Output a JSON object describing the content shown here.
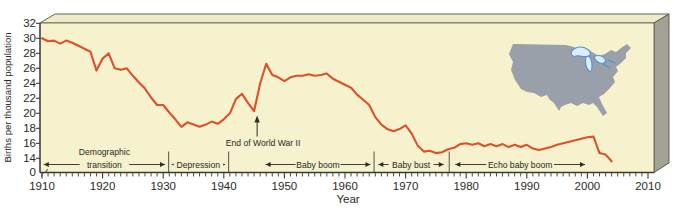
{
  "colors": {
    "page_background": "#ffffff",
    "plot_background": "#f5f2cd",
    "line": "#df5028",
    "axis": "#3c3b33",
    "text": "#2a2a24",
    "box_top_face": "#eeebc9",
    "box_side_face": "#a2a295",
    "box_outline": "#55544a",
    "map_land": "#9aa0a9",
    "map_lakes_stroke": "#4a93d6",
    "map_lakes_fill": "#ddeefb"
  },
  "figure": {
    "y_axis_title": "Births per thousand population",
    "x_axis_title": "Year"
  },
  "annotations": {
    "wwii_label": "End of World War II",
    "wwii_year": 1945.5,
    "divider_years": [
      1930.9,
      1940.8,
      1964.8,
      1977.2
    ],
    "periods": [
      {
        "id": "demographic-transition",
        "label_above": "Demographic",
        "label": "transition",
        "start": 1910.3,
        "end": 1930.3
      },
      {
        "id": "depression",
        "label_above": "",
        "label": "Depression",
        "start": 1931.4,
        "end": 1940.2
      },
      {
        "id": "baby-boom",
        "label_above": "",
        "label": "Baby boom",
        "start": 1946.9,
        "end": 1964.2
      },
      {
        "id": "baby-bust",
        "label_above": "",
        "label": "Baby bust",
        "start": 1965.5,
        "end": 1976.3
      },
      {
        "id": "echo-baby-boom",
        "label_above": "",
        "label": "Echo baby boom",
        "start": 1978.2,
        "end": 1999.6
      }
    ]
  },
  "chart_data": {
    "type": "line",
    "xlabel": "Year",
    "ylabel": "Births per thousand population",
    "x_range": [
      1910,
      2010
    ],
    "y_ticks": [
      0,
      14,
      16,
      18,
      20,
      22,
      24,
      26,
      28,
      30,
      32
    ],
    "y_axis_break_between": [
      0,
      14
    ],
    "x_tick_labels": [
      "1910",
      "1920",
      "1930",
      "1940",
      "1950",
      "1960",
      "1970",
      "1980",
      "1990",
      "2000",
      "2010"
    ],
    "grid": false,
    "legend": "none",
    "inset": "united-states-map",
    "series": [
      {
        "name": "U.S. births per thousand population",
        "color": "#df5028",
        "x": [
          1910,
          1911,
          1912,
          1913,
          1914,
          1915,
          1916,
          1917,
          1918,
          1919,
          1920,
          1921,
          1922,
          1923,
          1924,
          1925,
          1926,
          1927,
          1928,
          1929,
          1930,
          1931,
          1932,
          1933,
          1934,
          1935,
          1936,
          1937,
          1938,
          1939,
          1940,
          1941,
          1942,
          1943,
          1944,
          1945,
          1946,
          1947,
          1948,
          1949,
          1950,
          1951,
          1952,
          1953,
          1954,
          1955,
          1956,
          1957,
          1958,
          1959,
          1960,
          1961,
          1962,
          1963,
          1964,
          1965,
          1966,
          1967,
          1968,
          1969,
          1970,
          1971,
          1972,
          1973,
          1974,
          1975,
          1976,
          1977,
          1978,
          1979,
          1980,
          1981,
          1982,
          1983,
          1984,
          1985,
          1986,
          1987,
          1988,
          1989,
          1990,
          1991,
          1992,
          1993,
          1994,
          1995,
          1996,
          1997,
          1998,
          1999,
          2000,
          2001,
          2002,
          2003,
          2004
        ],
        "values": [
          30.0,
          29.6,
          29.7,
          29.3,
          29.7,
          29.4,
          29.0,
          28.6,
          28.2,
          25.7,
          27.3,
          28.0,
          26.0,
          25.8,
          26.0,
          25.0,
          24.1,
          23.3,
          22.1,
          21.1,
          21.1,
          20.1,
          19.2,
          18.2,
          18.8,
          18.5,
          18.2,
          18.5,
          18.9,
          18.6,
          19.2,
          20.0,
          21.9,
          22.6,
          21.4,
          20.3,
          24.0,
          26.6,
          25.1,
          24.8,
          24.3,
          24.8,
          25.0,
          25.0,
          25.2,
          25.0,
          25.1,
          25.3,
          24.6,
          24.2,
          23.8,
          23.4,
          22.5,
          21.8,
          21.1,
          19.5,
          18.5,
          17.9,
          17.6,
          17.9,
          18.4,
          17.3,
          15.7,
          14.9,
          15.0,
          14.7,
          14.8,
          15.2,
          15.4,
          15.9,
          16.0,
          15.8,
          16.0,
          15.6,
          15.9,
          15.6,
          15.9,
          15.5,
          15.8,
          15.5,
          15.8,
          15.3,
          15.1,
          15.3,
          15.5,
          15.8,
          16.0,
          16.2,
          16.4,
          16.6,
          16.8,
          16.9,
          14.7,
          14.5,
          13.6
        ]
      }
    ]
  }
}
